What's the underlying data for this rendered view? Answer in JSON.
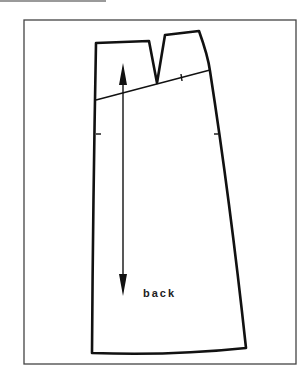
{
  "pattern": {
    "piece_label": "back",
    "stroke_color": "#111111",
    "frame_color": "#444444"
  }
}
